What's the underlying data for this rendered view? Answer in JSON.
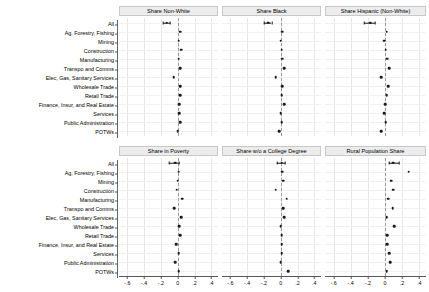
{
  "figure": {
    "layout": "2 rows x 3 columns of small-multiple coefficient panels",
    "categories": [
      "All",
      "Ag, Forestry, Fishing",
      "Mining",
      "Construction",
      "Manufacturing",
      "Transpo and Comms",
      "Elec, Gas, Sanitary Services",
      "Wholesale Trade",
      "Retail Trade",
      "Finance, Insur, and Real Estate",
      "Services",
      "Public Administration",
      "POTWs"
    ],
    "xticks": [
      "-.6",
      "-.4",
      "-.2",
      "0",
      ".2",
      ".4"
    ],
    "xtick_values": [
      -0.6,
      -0.4,
      -0.2,
      0,
      0.2,
      0.4
    ],
    "xlim": [
      -0.7,
      0.48
    ],
    "zero_reference": 0
  },
  "chart_data": {
    "type": "scatter",
    "title": "",
    "xlabel": "",
    "ylabel": "",
    "xlim": [
      -0.7,
      0.48
    ],
    "ylim": [
      0,
      13
    ],
    "grid": true,
    "legend": "none",
    "categories": [
      "All",
      "Ag, Forestry, Fishing",
      "Mining",
      "Construction",
      "Manufacturing",
      "Transpo and Comms",
      "Elec, Gas, Sanitary Services",
      "Wholesale Trade",
      "Retail Trade",
      "Finance, Insur, and Real Estate",
      "Services",
      "Public Administration",
      "POTWs"
    ],
    "xticks": [
      -0.6,
      -0.4,
      -0.2,
      0,
      0.2,
      0.4
    ],
    "xticklabels": [
      "-.6",
      "-.4",
      "-.2",
      "0",
      ".2",
      ".4"
    ],
    "panels": [
      {
        "title": "Share Non-White",
        "row": 0,
        "col": 0,
        "values": [
          -0.13,
          0.03,
          0.01,
          0.04,
          0.01,
          0.03,
          -0.05,
          0.03,
          0.03,
          0.02,
          0.02,
          0.03,
          0.0
        ],
        "ci_low": [
          -0.18,
          null,
          null,
          null,
          null,
          null,
          null,
          null,
          null,
          null,
          null,
          null,
          null
        ],
        "ci_high": [
          -0.09,
          null,
          null,
          null,
          null,
          null,
          null,
          null,
          null,
          null,
          null,
          null,
          null
        ]
      },
      {
        "title": "Share Black",
        "row": 0,
        "col": 1,
        "values": [
          -0.15,
          0.02,
          0.0,
          0.01,
          0.02,
          0.04,
          -0.06,
          0.02,
          0.01,
          0.04,
          0.0,
          0.01,
          -0.02
        ],
        "ci_low": [
          -0.2,
          null,
          null,
          null,
          null,
          null,
          null,
          null,
          null,
          null,
          null,
          null,
          null
        ],
        "ci_high": [
          -0.11,
          null,
          null,
          null,
          null,
          null,
          null,
          null,
          null,
          null,
          null,
          null,
          null
        ]
      },
      {
        "title": "Share Hispanic (Non-White)",
        "row": 0,
        "col": 2,
        "values": [
          -0.17,
          0.02,
          -0.01,
          0.01,
          0.03,
          0.05,
          -0.04,
          0.04,
          0.02,
          0.0,
          -0.01,
          0.01,
          -0.04
        ],
        "ci_low": [
          -0.24,
          null,
          null,
          null,
          null,
          null,
          null,
          null,
          null,
          null,
          null,
          null,
          null
        ],
        "ci_high": [
          -0.12,
          null,
          null,
          null,
          null,
          null,
          null,
          null,
          null,
          null,
          null,
          null,
          null
        ]
      },
      {
        "title": "Share in Poverty",
        "row": 1,
        "col": 0,
        "values": [
          -0.03,
          0.01,
          0.0,
          -0.01,
          0.05,
          -0.04,
          0.04,
          0.02,
          0.03,
          -0.02,
          0.01,
          -0.03,
          0.01
        ],
        "ci_low": [
          -0.1,
          null,
          null,
          null,
          null,
          null,
          null,
          null,
          null,
          null,
          null,
          null,
          null
        ],
        "ci_high": [
          0.01,
          null,
          null,
          null,
          null,
          null,
          null,
          null,
          null,
          null,
          null,
          null,
          null
        ]
      },
      {
        "title": "Share w/o a College Degree",
        "row": 1,
        "col": 1,
        "values": [
          0.01,
          0.02,
          0.03,
          -0.06,
          0.07,
          0.03,
          0.04,
          0.0,
          0.01,
          0.01,
          0.01,
          0.0,
          0.09
        ],
        "ci_low": [
          -0.04,
          null,
          null,
          null,
          null,
          null,
          null,
          null,
          null,
          null,
          null,
          null,
          null
        ],
        "ci_high": [
          0.05,
          null,
          null,
          null,
          null,
          null,
          null,
          null,
          null,
          null,
          null,
          null,
          null
        ]
      },
      {
        "title": "Rural Population Share",
        "row": 1,
        "col": 2,
        "values": [
          0.1,
          0.28,
          0.07,
          0.1,
          0.04,
          0.09,
          0.02,
          0.11,
          0.03,
          0.03,
          0.05,
          0.06,
          0.02,
          0.18
        ],
        "ci_low": [
          0.05,
          null,
          null,
          null,
          null,
          null,
          null,
          null,
          null,
          null,
          null,
          null,
          null
        ],
        "ci_high": [
          0.16,
          null,
          null,
          null,
          null,
          null,
          null,
          null,
          null,
          null,
          null,
          null,
          null
        ]
      }
    ]
  },
  "colors": {
    "marker": "#1a1a1a",
    "grid": "#e6e6e6",
    "zero_line": "#9a9a9a",
    "panel_title_bg": "#ececec",
    "axis": "#555555",
    "background": "#ffffff"
  }
}
